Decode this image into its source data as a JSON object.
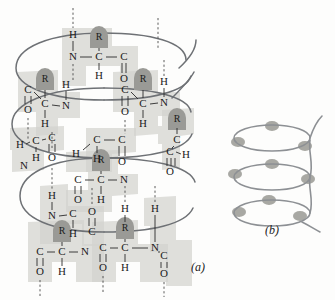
{
  "figure": {
    "panels": [
      {
        "id": "a",
        "label": "(a)",
        "description": "Detailed atomic model of the alpha helix showing backbone atoms, peptide planes and hydrogen bonds"
      },
      {
        "id": "b",
        "label": "(b)",
        "description": "Simplified coil representation of the alpha helix with side-chain markers"
      }
    ]
  },
  "legend": {
    "atom_names": {
      "N": "nitrogen",
      "C": "carbon",
      "O": "oxygen",
      "H": "hydrogen",
      "R": "side-chain-group"
    }
  },
  "panel_a": {
    "label": "(a)",
    "label_pos": {
      "x": 198,
      "y": 268
    },
    "atoms": [
      {
        "id": "a1",
        "text": "H",
        "x": 73,
        "y": 35
      },
      {
        "id": "a2",
        "text": "R",
        "x": 99,
        "y": 38
      },
      {
        "id": "a3",
        "text": "N",
        "x": 73,
        "y": 57
      },
      {
        "id": "a4",
        "text": "C",
        "x": 99,
        "y": 57
      },
      {
        "id": "a5",
        "text": "C",
        "x": 124,
        "y": 57
      },
      {
        "id": "a6",
        "text": "H",
        "x": 99,
        "y": 76
      },
      {
        "id": "a7",
        "text": "O",
        "x": 124,
        "y": 79
      },
      {
        "id": "b1",
        "text": "C",
        "x": 28,
        "y": 90
      },
      {
        "id": "b2",
        "text": "O",
        "x": 28,
        "y": 110
      },
      {
        "id": "b3",
        "text": "R",
        "x": 45,
        "y": 80
      },
      {
        "id": "b4",
        "text": "C",
        "x": 45,
        "y": 104
      },
      {
        "id": "b5",
        "text": "N",
        "x": 66,
        "y": 106
      },
      {
        "id": "b6",
        "text": "H",
        "x": 66,
        "y": 85
      },
      {
        "id": "b7",
        "text": "H",
        "x": 45,
        "y": 124
      },
      {
        "id": "c1",
        "text": "H",
        "x": 20,
        "y": 145
      },
      {
        "id": "c2",
        "text": "C",
        "x": 36,
        "y": 141
      },
      {
        "id": "c3",
        "text": "C",
        "x": 52,
        "y": 138
      },
      {
        "id": "c4",
        "text": "H",
        "x": 36,
        "y": 158
      },
      {
        "id": "c5",
        "text": "O",
        "x": 52,
        "y": 158
      },
      {
        "id": "c6",
        "text": "N",
        "x": 24,
        "y": 166
      },
      {
        "id": "d1",
        "text": "C",
        "x": 125,
        "y": 90
      },
      {
        "id": "d2",
        "text": "O",
        "x": 125,
        "y": 112
      },
      {
        "id": "d3",
        "text": "R",
        "x": 143,
        "y": 80
      },
      {
        "id": "d4",
        "text": "C",
        "x": 143,
        "y": 104
      },
      {
        "id": "d5",
        "text": "N",
        "x": 164,
        "y": 103
      },
      {
        "id": "d6",
        "text": "H",
        "x": 164,
        "y": 82
      },
      {
        "id": "d7",
        "text": "H",
        "x": 143,
        "y": 124
      },
      {
        "id": "e1",
        "text": "C",
        "x": 97,
        "y": 140
      },
      {
        "id": "e2",
        "text": "C",
        "x": 122,
        "y": 140
      },
      {
        "id": "e3",
        "text": "H",
        "x": 97,
        "y": 159
      },
      {
        "id": "e4",
        "text": "O",
        "x": 122,
        "y": 162
      },
      {
        "id": "e5",
        "text": "H",
        "x": 76,
        "y": 154
      },
      {
        "id": "f1",
        "text": "R",
        "x": 177,
        "y": 120
      },
      {
        "id": "f2",
        "text": "C",
        "x": 177,
        "y": 140
      },
      {
        "id": "f3",
        "text": "C",
        "x": 170,
        "y": 152
      },
      {
        "id": "f4",
        "text": "H",
        "x": 186,
        "y": 155
      },
      {
        "id": "f5",
        "text": "O",
        "x": 170,
        "y": 172
      },
      {
        "id": "g1",
        "text": "R",
        "x": 101,
        "y": 161
      },
      {
        "id": "g2",
        "text": "C",
        "x": 78,
        "y": 180
      },
      {
        "id": "g3",
        "text": "C",
        "x": 101,
        "y": 180
      },
      {
        "id": "g4",
        "text": "N",
        "x": 124,
        "y": 180
      },
      {
        "id": "g5",
        "text": "H",
        "x": 101,
        "y": 200
      },
      {
        "id": "g6",
        "text": "O",
        "x": 78,
        "y": 200
      },
      {
        "id": "h1",
        "text": "H",
        "x": 52,
        "y": 196
      },
      {
        "id": "h2",
        "text": "N",
        "x": 52,
        "y": 216
      },
      {
        "id": "h3",
        "text": "C",
        "x": 73,
        "y": 214
      },
      {
        "id": "h4",
        "text": "O",
        "x": 92,
        "y": 212
      },
      {
        "id": "h5",
        "text": "C",
        "x": 92,
        "y": 232
      },
      {
        "id": "h6",
        "text": "H",
        "x": 73,
        "y": 234
      },
      {
        "id": "i1",
        "text": "R",
        "x": 62,
        "y": 232
      },
      {
        "id": "i2",
        "text": "C",
        "x": 40,
        "y": 252
      },
      {
        "id": "i3",
        "text": "C",
        "x": 62,
        "y": 252
      },
      {
        "id": "i4",
        "text": "N",
        "x": 85,
        "y": 252
      },
      {
        "id": "i5",
        "text": "O",
        "x": 40,
        "y": 272
      },
      {
        "id": "i6",
        "text": "H",
        "x": 62,
        "y": 272
      },
      {
        "id": "j1",
        "text": "H",
        "x": 125,
        "y": 209
      },
      {
        "id": "j2",
        "text": "R",
        "x": 125,
        "y": 229
      },
      {
        "id": "j3",
        "text": "H",
        "x": 155,
        "y": 209
      },
      {
        "id": "j4",
        "text": "C",
        "x": 103,
        "y": 248
      },
      {
        "id": "j5",
        "text": "C",
        "x": 125,
        "y": 248
      },
      {
        "id": "j6",
        "text": "N",
        "x": 155,
        "y": 248
      },
      {
        "id": "j7",
        "text": "H",
        "x": 125,
        "y": 268
      },
      {
        "id": "j8",
        "text": "O",
        "x": 103,
        "y": 268
      },
      {
        "id": "j9",
        "text": "C",
        "x": 164,
        "y": 256
      },
      {
        "id": "j10",
        "text": "O",
        "x": 164,
        "y": 274
      }
    ],
    "hydrogen_bonds": [
      {
        "x": 73,
        "y1": 8,
        "y2": 28
      },
      {
        "x": 158,
        "y1": 18,
        "y2": 48
      },
      {
        "x": 73,
        "y1": 64,
        "y2": 80
      },
      {
        "x": 28,
        "y1": 118,
        "y2": 140
      },
      {
        "x": 52,
        "y1": 132,
        "y2": 150
      },
      {
        "x": 52,
        "y1": 168,
        "y2": 190
      },
      {
        "x": 125,
        "y1": 120,
        "y2": 134
      },
      {
        "x": 164,
        "y1": 60,
        "y2": 76
      },
      {
        "x": 155,
        "y1": 186,
        "y2": 203
      },
      {
        "x": 92,
        "y1": 188,
        "y2": 206
      },
      {
        "x": 125,
        "y1": 186,
        "y2": 203
      },
      {
        "x": 40,
        "y1": 280,
        "y2": 296
      },
      {
        "x": 103,
        "y1": 276,
        "y2": 294
      },
      {
        "x": 164,
        "y1": 282,
        "y2": 297
      }
    ]
  },
  "panel_b": {
    "label": "(b)",
    "label_pos": {
      "x": 272,
      "y": 231
    },
    "turns": 3,
    "side_chain_markers": 9,
    "center_x": 272,
    "ellipse_rx": 38,
    "ellipse_ry": 13,
    "turn_ys": [
      138,
      177,
      213
    ]
  },
  "colors": {
    "background": "#fdfdfc",
    "peptide_plane": "#d2d2cf",
    "side_chain_dome": "#9a9a96",
    "bond_stroke": "#2a2a2a",
    "helix_stroke": "#6e7175",
    "helix_b_stroke": "#8d9094",
    "text": "#1b1b1b"
  }
}
